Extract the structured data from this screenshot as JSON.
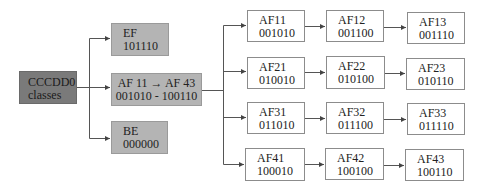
{
  "diagram": {
    "root": {
      "id": "root",
      "line1": "CCCDD0",
      "line2": "classes",
      "fill": "#7a7a7a"
    },
    "level1": [
      {
        "id": "ef",
        "line1": "EF",
        "line2": "101110",
        "fill": "#b4b4b4"
      },
      {
        "id": "af-range",
        "line1": "AF 11 → AF 43",
        "line2": "001010 -  100110",
        "fill": "#b4b4b4"
      },
      {
        "id": "be",
        "line1": "BE",
        "line2": "000000",
        "fill": "#b4b4b4"
      }
    ],
    "af_grid": [
      [
        {
          "label": "AF11",
          "code": "001010"
        },
        {
          "label": "AF12",
          "code": "001100"
        },
        {
          "label": "AF13",
          "code": "001110"
        }
      ],
      [
        {
          "label": "AF21",
          "code": "010010"
        },
        {
          "label": "AF22",
          "code": "010100"
        },
        {
          "label": "AF23",
          "code": "010110"
        }
      ],
      [
        {
          "label": "AF31",
          "code": "011010"
        },
        {
          "label": "AF32",
          "code": "011100"
        },
        {
          "label": "AF33",
          "code": "011110"
        }
      ],
      [
        {
          "label": "AF41",
          "code": "100010"
        },
        {
          "label": "AF42",
          "code": "100100"
        },
        {
          "label": "AF43",
          "code": "100110"
        }
      ]
    ],
    "colors": {
      "line": "#555555",
      "box_border": "#8c8c8c",
      "dark_fill": "#7a7a7a",
      "gray_fill": "#b4b4b4"
    }
  }
}
